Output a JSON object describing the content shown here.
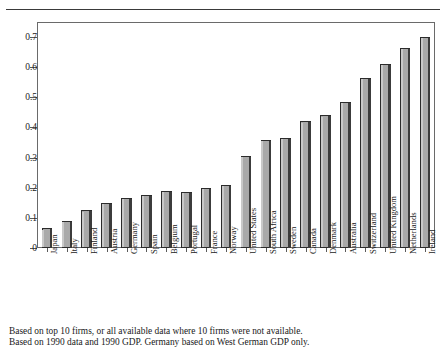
{
  "figure": {
    "title_cropped": "",
    "footnotes": [
      "Based on top 10 firms, or all available data where 10 firms were not available.",
      "Based on 1990 data and 1990 GDP. Germany based on West German GDP only."
    ]
  },
  "chart_data": {
    "type": "bar",
    "title": "",
    "xlabel": "",
    "ylabel": "",
    "ylim": [
      0,
      0.75
    ],
    "yticks": [
      0,
      0.1,
      0.2,
      0.3,
      0.4,
      0.5,
      0.6,
      0.7
    ],
    "ytick_labels": [
      "0",
      "0.1",
      "0.2",
      "0.3",
      "0.4",
      "0.5",
      "0.6",
      "0.7"
    ],
    "grid": false,
    "legend": false,
    "bar_color": "#a9a9a9",
    "bar_edge_color": "#2b2b2b",
    "categories": [
      "Japan",
      "Italy",
      "Finland",
      "Austria",
      "Germany",
      "Spain",
      "Belgium",
      "Portugal",
      "France",
      "Norway",
      "United States",
      "South Africa",
      "Sweden",
      "Canada",
      "Denmark",
      "Australia",
      "Switzerland",
      "United Kingdom",
      "Netherlands",
      "Ireland"
    ],
    "values": [
      0.065,
      0.09,
      0.125,
      0.15,
      0.165,
      0.175,
      0.19,
      0.185,
      0.2,
      0.21,
      0.305,
      0.36,
      0.365,
      0.42,
      0.44,
      0.485,
      0.565,
      0.61,
      0.665,
      0.7
    ]
  }
}
